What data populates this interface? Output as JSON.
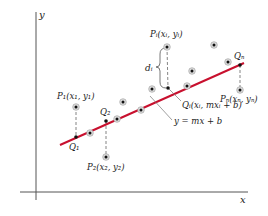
{
  "diagram": {
    "axes": {
      "x_label": "x",
      "y_label": "y"
    },
    "line": {
      "label": "y = mx + b",
      "color": "#c8102e"
    },
    "labels": {
      "P1": "P₁(x₁, y₁)",
      "P2": "P₂(x₂, y₂)",
      "Pi": "Pᵢ(xᵢ, yᵢ)",
      "Pn": "Pₙ(xₙ, yₙ)",
      "Q1": "Q₁",
      "Q2": "Q₂",
      "Qi": "Qᵢ(xᵢ, mxᵢ + b)",
      "Qn": "Qₙ",
      "di": "dᵢ",
      "line_eq": "y = mx + b"
    },
    "points": [
      {
        "name": "P1",
        "x": 76,
        "y": 107
      },
      {
        "name": "P2",
        "x": 106,
        "y": 157
      },
      {
        "name": "Pi",
        "x": 167,
        "y": 47
      },
      {
        "name": "Pn",
        "x": 240,
        "y": 90
      },
      {
        "name": "p",
        "x": 90,
        "y": 133
      },
      {
        "name": "p",
        "x": 117,
        "y": 119
      },
      {
        "name": "p",
        "x": 123,
        "y": 102
      },
      {
        "name": "p",
        "x": 141,
        "y": 110
      },
      {
        "name": "p",
        "x": 152,
        "y": 89
      },
      {
        "name": "p",
        "x": 187,
        "y": 86
      },
      {
        "name": "p",
        "x": 192,
        "y": 71
      },
      {
        "name": "p",
        "x": 214,
        "y": 45
      },
      {
        "name": "p",
        "x": 228,
        "y": 62
      }
    ],
    "line_points": [
      {
        "name": "Q1",
        "x": 76,
        "y": 137
      },
      {
        "name": "Q2",
        "x": 106,
        "y": 121
      },
      {
        "name": "Qi",
        "x": 168,
        "y": 88
      },
      {
        "name": "Qn",
        "x": 240,
        "y": 65
      }
    ]
  }
}
